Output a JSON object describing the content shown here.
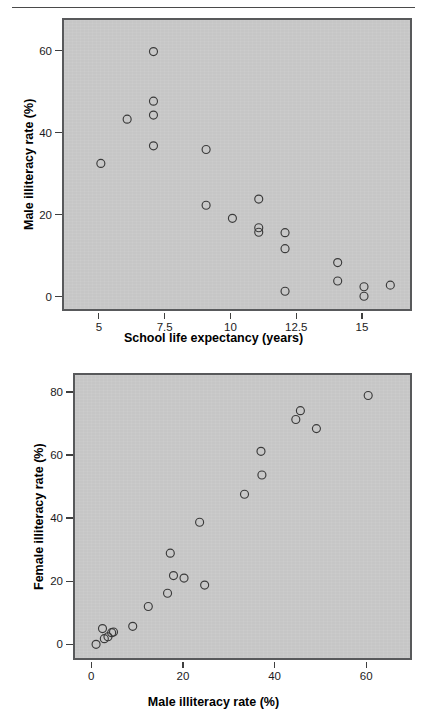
{
  "header": {
    "clipped_text": ""
  },
  "chart_data": [
    {
      "id": "male-illiteracy-vs-school-life-expectancy",
      "type": "scatter",
      "title": "",
      "xlabel": "School life expectancy (years)",
      "ylabel": "Male illiteracy rate (%)",
      "xlim": [
        3.6,
        16.9
      ],
      "ylim": [
        -3.5,
        68
      ],
      "xticks": [
        5,
        7.5,
        10,
        12.5,
        15
      ],
      "xtick_labels": [
        "5",
        "7.5",
        "10",
        "12.5",
        "15"
      ],
      "yticks": [
        0,
        20,
        40,
        60
      ],
      "ytick_labels": [
        "0",
        "20",
        "40",
        "60"
      ],
      "grid": false,
      "legend": "none",
      "marker": "open-circle",
      "point_color": "#3a3a3a",
      "plot_bg": "#c6c6c6",
      "points": [
        {
          "x": 5.0,
          "y": 33.0
        },
        {
          "x": 6.0,
          "y": 43.8
        },
        {
          "x": 7.0,
          "y": 60.3
        },
        {
          "x": 7.0,
          "y": 48.2
        },
        {
          "x": 7.0,
          "y": 44.8
        },
        {
          "x": 7.0,
          "y": 37.3
        },
        {
          "x": 9.0,
          "y": 36.4
        },
        {
          "x": 9.0,
          "y": 22.8
        },
        {
          "x": 10.0,
          "y": 19.6
        },
        {
          "x": 11.0,
          "y": 24.3
        },
        {
          "x": 11.0,
          "y": 17.3
        },
        {
          "x": 11.0,
          "y": 16.2
        },
        {
          "x": 12.0,
          "y": 16.1
        },
        {
          "x": 12.0,
          "y": 12.2
        },
        {
          "x": 12.0,
          "y": 1.8
        },
        {
          "x": 14.0,
          "y": 8.8
        },
        {
          "x": 14.0,
          "y": 4.3
        },
        {
          "x": 15.0,
          "y": 2.9
        },
        {
          "x": 15.0,
          "y": 0.6
        },
        {
          "x": 16.0,
          "y": 3.3
        }
      ]
    },
    {
      "id": "female-vs-male-illiteracy",
      "type": "scatter",
      "title": "",
      "xlabel": "Male illiteracy rate (%)",
      "ylabel": "Female illiteracy rate (%)",
      "xlim": [
        -4,
        70
      ],
      "ylim": [
        -5,
        86
      ],
      "xticks": [
        0,
        20,
        40,
        60
      ],
      "xtick_labels": [
        "0",
        "20",
        "40",
        "60"
      ],
      "yticks": [
        0,
        20,
        40,
        60,
        80
      ],
      "ytick_labels": [
        "0",
        "20",
        "40",
        "60",
        "80"
      ],
      "grid": false,
      "legend": "none",
      "marker": "open-circle",
      "point_color": "#3a3a3a",
      "plot_bg": "#c6c6c6",
      "points": [
        {
          "x": 0.6,
          "y": 0.6
        },
        {
          "x": 2.0,
          "y": 5.6
        },
        {
          "x": 2.4,
          "y": 2.4
        },
        {
          "x": 3.2,
          "y": 3.0
        },
        {
          "x": 4.0,
          "y": 4.3
        },
        {
          "x": 4.4,
          "y": 4.5
        },
        {
          "x": 8.6,
          "y": 6.3
        },
        {
          "x": 12.0,
          "y": 12.6
        },
        {
          "x": 16.2,
          "y": 16.8
        },
        {
          "x": 16.8,
          "y": 29.5
        },
        {
          "x": 17.5,
          "y": 22.4
        },
        {
          "x": 19.8,
          "y": 21.6
        },
        {
          "x": 23.2,
          "y": 39.3
        },
        {
          "x": 24.3,
          "y": 19.4
        },
        {
          "x": 33.0,
          "y": 48.2
        },
        {
          "x": 36.6,
          "y": 61.8
        },
        {
          "x": 36.8,
          "y": 54.3
        },
        {
          "x": 44.2,
          "y": 71.9
        },
        {
          "x": 45.2,
          "y": 74.7
        },
        {
          "x": 48.7,
          "y": 69.0
        },
        {
          "x": 60.0,
          "y": 79.5
        }
      ]
    }
  ]
}
